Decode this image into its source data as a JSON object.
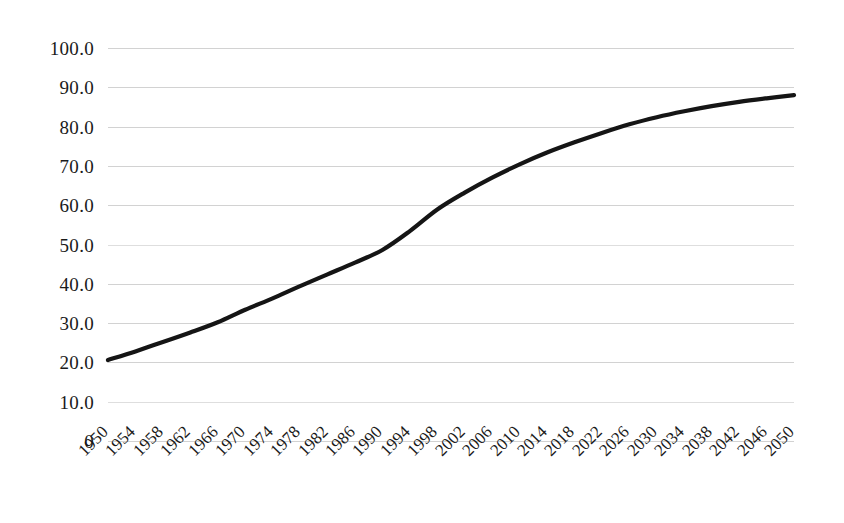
{
  "chart_data": {
    "type": "line",
    "title": "",
    "subtitle": "",
    "xlabel": "",
    "ylabel": "",
    "legend": [],
    "legend_position": "none",
    "grid": true,
    "grid_orientation": "horizontal",
    "xlim": [
      1950,
      2050
    ],
    "ylim": [
      0,
      100
    ],
    "ytick_labels": [
      "100.0",
      "90.0",
      "80.0",
      "70.0",
      "60.0",
      "50.0",
      "40.0",
      "30.0",
      "20.0",
      "10.0",
      "0"
    ],
    "ytick_values": [
      100,
      90,
      80,
      70,
      60,
      50,
      40,
      30,
      20,
      10,
      0
    ],
    "xtick_labels": [
      "1950",
      "1954",
      "1958",
      "1962",
      "1966",
      "1970",
      "1974",
      "1978",
      "1982",
      "1986",
      "1990",
      "1994",
      "1998",
      "2002",
      "2006",
      "2010",
      "2014",
      "2018",
      "2022",
      "2026",
      "2030",
      "2034",
      "2038",
      "2042",
      "2046",
      "2050"
    ],
    "xtick_rotation": -45,
    "categories": [
      1950,
      1954,
      1958,
      1962,
      1966,
      1970,
      1974,
      1978,
      1982,
      1986,
      1990,
      1994,
      1998,
      2002,
      2006,
      2010,
      2014,
      2018,
      2022,
      2026,
      2030,
      2034,
      2038,
      2042,
      2046,
      2050
    ],
    "series": [
      {
        "name": "Urban population share",
        "color": "#151515",
        "line_width": 4,
        "markers": false,
        "values": [
          20.6,
          22.8,
          25.2,
          27.6,
          30.2,
          33.4,
          36.3,
          39.4,
          42.4,
          45.4,
          48.6,
          53.4,
          58.9,
          63.2,
          67.0,
          70.4,
          73.4,
          76.0,
          78.4,
          80.6,
          82.4,
          83.9,
          85.2,
          86.3,
          87.2,
          88.0
        ]
      }
    ]
  },
  "axes": {
    "y_tick_0": "100.0",
    "y_tick_1": "90.0",
    "y_tick_2": "80.0",
    "y_tick_3": "70.0",
    "y_tick_4": "60.0",
    "y_tick_5": "50.0",
    "y_tick_6": "40.0",
    "y_tick_7": "30.0",
    "y_tick_8": "20.0",
    "y_tick_9": "10.0",
    "y_tick_10": "0"
  }
}
